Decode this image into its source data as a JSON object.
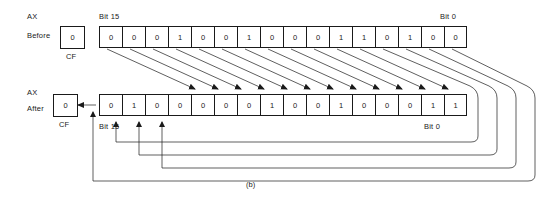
{
  "figure": {
    "caption": "(b)",
    "operation": "rotate-left-through-carry-by-4",
    "register_name": "AX",
    "flag_name": "CF",
    "shift_amount": 4,
    "bit_count": 16
  },
  "labels": {
    "ax_top": "AX",
    "ax_bottom": "AX",
    "before": "Before",
    "after": "After",
    "cf_before": "CF",
    "cf_after": "CF",
    "bit15_top": "Bit 15",
    "bit0_top": "Bit 0",
    "bit15_bottom": "Bit 15",
    "bit0_bottom": "Bit 0"
  },
  "rows": {
    "before": {
      "cf_value": "0",
      "bits": [
        "0",
        "0",
        "0",
        "1",
        "0",
        "0",
        "1",
        "0",
        "0",
        "0",
        "1",
        "1",
        "0",
        "1",
        "0",
        "0"
      ]
    },
    "after": {
      "cf_value": "0",
      "bits": [
        "0",
        "1",
        "0",
        "0",
        "0",
        "0",
        "0",
        "1",
        "0",
        "0",
        "1",
        "0",
        "0",
        "0",
        "1",
        "1"
      ]
    }
  },
  "colors": {
    "line": "#1a1a1a",
    "background": "#ffffff",
    "text": "#1a1a1a"
  }
}
